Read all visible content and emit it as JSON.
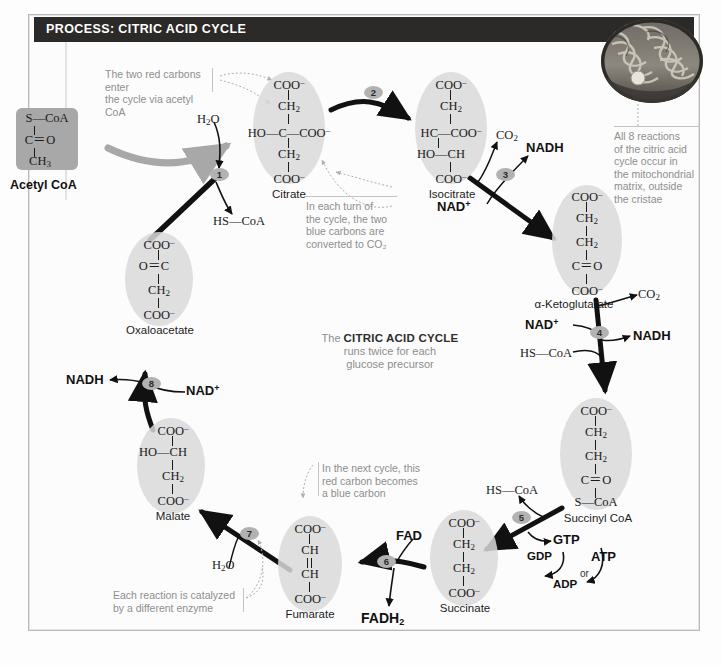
{
  "header": {
    "title": "PROCESS: CITRIC ACID CYCLE"
  },
  "acetyl": {
    "label": "Acetyl CoA",
    "l1": "S—CoA",
    "l2": "C＝O",
    "l3": "CH3"
  },
  "centre_caption": {
    "line1_light": "The ",
    "line1_bold": "CITRIC ACID CYCLE",
    "line2": "runs twice for each",
    "line3": "glucose precursor"
  },
  "annotations": {
    "red_carbons": "The two red carbons enter\nthe cycle via acetyl CoA",
    "each_turn": "In each turn of\nthe cycle, the two\nblue carbons are\nconverted to CO₂",
    "mitochondrion": "All 8 reactions\nof the citric acid\ncycle occur in\nthe mitochondrial\nmatrix, outside\nthe cristae",
    "next_cycle": "In the next cycle, this\nred carbon becomes\na blue carbon",
    "enzyme": "Each reaction is catalyzed\nby a different enzyme"
  },
  "molecules": [
    {
      "id": "citrate",
      "name": "Citrate",
      "lines": [
        "COO−",
        "CH2",
        "HO—C—COO−",
        "CH2",
        "COO−"
      ]
    },
    {
      "id": "isocitrate",
      "name": "Isocitrate",
      "lines": [
        "COO−",
        "CH2",
        "HC—COO−",
        "HO—CH",
        "COO−"
      ]
    },
    {
      "id": "ketoglutarate",
      "name": "α-Ketoglutarate",
      "lines": [
        "COO−",
        "CH2",
        "CH2",
        "C＝O",
        "COO−"
      ]
    },
    {
      "id": "succinyl-coa",
      "name": "Succinyl CoA",
      "lines": [
        "COO−",
        "CH2",
        "CH2",
        "C＝O",
        "S—CoA"
      ]
    },
    {
      "id": "succinate",
      "name": "Succinate",
      "lines": [
        "COO−",
        "CH2",
        "CH2",
        "COO−"
      ]
    },
    {
      "id": "fumarate",
      "name": "Fumarate",
      "lines": [
        "COO−",
        "CH",
        "CH",
        "COO−"
      ]
    },
    {
      "id": "malate",
      "name": "Malate",
      "lines": [
        "COO−",
        "HO—CH",
        "CH2",
        "COO−"
      ]
    },
    {
      "id": "oxaloacetate",
      "name": "Oxaloacetate",
      "lines": [
        "COO−",
        "O＝C",
        "CH2",
        "COO−"
      ]
    }
  ],
  "steps": [
    "1",
    "2",
    "3",
    "4",
    "5",
    "6",
    "7",
    "8"
  ],
  "cofactors": {
    "water_top": "H2O",
    "water_bottom": "H2O",
    "hs_coa_step1": "HS—CoA",
    "hs_coa_step4": "HS—CoA",
    "hs_coa_step5": "HS—CoA",
    "co2_step3": "CO2",
    "co2_step4": "CO2",
    "nadh_step3": "NADH",
    "nadh_step4": "NADH",
    "nadh_step8": "NADH",
    "nad_step3": "NAD+",
    "nad_step4": "NAD+",
    "nad_step8": "NAD+",
    "fad": "FAD",
    "fadh2": "FADH2",
    "gtp": "GTP",
    "gdp": "GDP",
    "atp": "ATP",
    "adp": "ADP",
    "or": "or"
  },
  "colors": {
    "titlebar_bg": "#2b2a28",
    "blob_gray": "#d9d9d9",
    "step_badge": "#b2b2b2",
    "annotation_text": "#8e8e8e",
    "acetyl_box": "#a8a8a8",
    "arrow_black": "#111111",
    "arrow_gray": "#a8a8a8"
  }
}
